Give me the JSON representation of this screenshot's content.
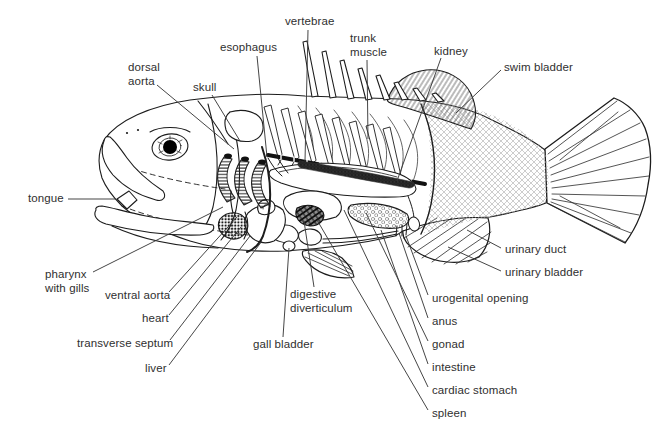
{
  "canvas": {
    "width": 660,
    "height": 442,
    "background": "#ffffff"
  },
  "style": {
    "ink": "#1c1c1c",
    "label_color": "#2f2f2f",
    "leader_color": "#3b3b3b",
    "label_font_size": 11.5
  },
  "labels": [
    {
      "id": "vertebrae",
      "text": "vertebrae",
      "x": 285,
      "y": 15,
      "leader": [
        [
          308,
          30
        ],
        [
          305,
          161
        ]
      ]
    },
    {
      "id": "esophagus",
      "text": "esophagus",
      "x": 220,
      "y": 41,
      "leader": [
        [
          257,
          56
        ],
        [
          267,
          157
        ]
      ]
    },
    {
      "id": "dorsal-aorta",
      "text": "dorsal\naorta",
      "x": 128,
      "y": 61,
      "leader": [
        [
          157,
          85
        ],
        [
          234,
          149
        ]
      ]
    },
    {
      "id": "skull",
      "text": "skull",
      "x": 193,
      "y": 81,
      "leader": [
        [
          212,
          95
        ],
        [
          240,
          141
        ]
      ]
    },
    {
      "id": "trunk-muscle",
      "text": "trunk\nmuscle",
      "x": 350,
      "y": 32,
      "leader": [
        [
          367,
          60
        ],
        [
          368,
          139
        ]
      ]
    },
    {
      "id": "kidney",
      "text": "kidney",
      "x": 434,
      "y": 45,
      "leader": [
        [
          441,
          58
        ],
        [
          397,
          181
        ]
      ]
    },
    {
      "id": "swim-bladder",
      "text": "swim bladder",
      "x": 504,
      "y": 61,
      "leader": [
        [
          501,
          70
        ],
        [
          456,
          113
        ]
      ]
    },
    {
      "id": "tongue",
      "text": "tongue",
      "x": 28,
      "y": 192,
      "leader": [
        [
          68,
          199
        ],
        [
          116,
          199
        ]
      ]
    },
    {
      "id": "pharynx-with-gills",
      "text": "pharynx\nwith gills",
      "x": 45,
      "y": 268,
      "leader": [
        [
          93,
          272
        ],
        [
          223,
          207
        ]
      ]
    },
    {
      "id": "ventral-aorta",
      "text": "ventral aorta",
      "x": 105,
      "y": 289,
      "leader": [
        [
          169,
          292
        ],
        [
          237,
          217
        ]
      ]
    },
    {
      "id": "heart",
      "text": "heart",
      "x": 142,
      "y": 312,
      "leader": [
        [
          169,
          315
        ],
        [
          241,
          227
        ]
      ]
    },
    {
      "id": "transverse-septum",
      "text": "transverse septum",
      "x": 77,
      "y": 337,
      "leader": [
        [
          170,
          340
        ],
        [
          250,
          236
        ]
      ]
    },
    {
      "id": "liver",
      "text": "liver",
      "x": 145,
      "y": 362,
      "leader": [
        [
          169,
          365
        ],
        [
          262,
          241
        ]
      ]
    },
    {
      "id": "gall-bladder",
      "text": "gall bladder",
      "x": 253,
      "y": 338,
      "leader": [
        [
          283,
          337
        ],
        [
          289,
          248
        ]
      ]
    },
    {
      "id": "digestive-diverticulum",
      "text": "digestive\ndiverticulum",
      "x": 290,
      "y": 288,
      "leader": [
        [
          314,
          287
        ],
        [
          304,
          221
        ]
      ]
    },
    {
      "id": "urinary-duct",
      "text": "urinary duct",
      "x": 505,
      "y": 243,
      "leader": [
        [
          501,
          248
        ],
        [
          467,
          230
        ]
      ]
    },
    {
      "id": "urinary-bladder",
      "text": "urinary bladder",
      "x": 505,
      "y": 266,
      "leader": [
        [
          501,
          271
        ],
        [
          448,
          247
        ]
      ]
    },
    {
      "id": "urogenital-opening",
      "text": "urogenital opening",
      "x": 432,
      "y": 292,
      "leader": [
        [
          428,
          295
        ],
        [
          406,
          236
        ]
      ]
    },
    {
      "id": "anus",
      "text": "anus",
      "x": 432,
      "y": 315,
      "leader": [
        [
          428,
          318
        ],
        [
          399,
          233
        ]
      ]
    },
    {
      "id": "gonad",
      "text": "gonad",
      "x": 432,
      "y": 338,
      "leader": [
        [
          428,
          341
        ],
        [
          366,
          213
        ]
      ]
    },
    {
      "id": "intestine",
      "text": "intestine",
      "x": 432,
      "y": 361,
      "leader": [
        [
          428,
          364
        ],
        [
          381,
          230
        ]
      ]
    },
    {
      "id": "cardiac-stomach",
      "text": "cardiac stomach",
      "x": 432,
      "y": 384,
      "leader": [
        [
          428,
          387
        ],
        [
          344,
          210
        ]
      ]
    },
    {
      "id": "spleen",
      "text": "spleen",
      "x": 432,
      "y": 407,
      "leader": [
        [
          428,
          410
        ],
        [
          317,
          220
        ]
      ]
    }
  ]
}
